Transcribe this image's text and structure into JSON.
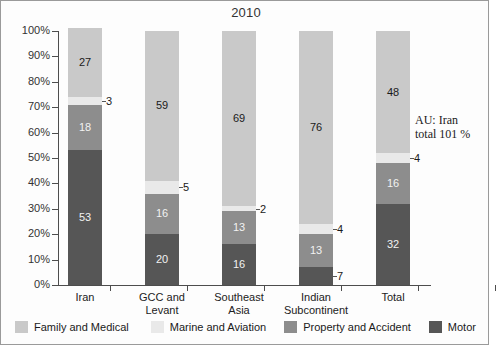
{
  "chart_data": {
    "type": "bar",
    "subtype": "stacked-percentage-column",
    "title": "2010",
    "xlabel": "",
    "ylabel": "",
    "ylim": [
      0,
      100
    ],
    "ytick_labels": [
      "100%",
      "90%",
      "80%",
      "70%",
      "60%",
      "50%",
      "40%",
      "30%",
      "20%",
      "10%",
      "0%"
    ],
    "ytick_values": [
      100,
      90,
      80,
      70,
      60,
      50,
      40,
      30,
      20,
      10,
      0
    ],
    "grid": false,
    "legend_position": "bottom",
    "categories": [
      "Iran",
      "GCC and Levant",
      "Southeast Asia",
      "Indian Subcontinent",
      "Total"
    ],
    "category_lines": [
      [
        "Iran",
        ""
      ],
      [
        "GCC and",
        "Levant"
      ],
      [
        "Southeast",
        "Asia"
      ],
      [
        "Indian",
        "Subcontinent"
      ],
      [
        "Total",
        ""
      ]
    ],
    "series": [
      {
        "name": "Family and Medical",
        "color": "#c9c9c9",
        "values": [
          27,
          59,
          69,
          76,
          48
        ]
      },
      {
        "name": "Marine and Aviation",
        "color": "#e9e9e9",
        "values": [
          3,
          5,
          2,
          4,
          4
        ]
      },
      {
        "name": "Property and Accident",
        "color": "#8d8d8d",
        "values": [
          18,
          16,
          13,
          13,
          16
        ]
      },
      {
        "name": "Motor",
        "color": "#565656",
        "values": [
          53,
          20,
          16,
          7,
          32
        ]
      }
    ],
    "annotations": [
      {
        "id": "au-note",
        "text_lines": [
          "AU: Iran",
          "total 101 %"
        ]
      }
    ]
  },
  "legend": {
    "items": [
      {
        "label": "Family and Medical",
        "color": "#c9c9c9"
      },
      {
        "label": "Marine and Aviation",
        "color": "#e9e9e9"
      },
      {
        "label": "Property and Accident",
        "color": "#8d8d8d"
      },
      {
        "label": "Motor",
        "color": "#565656"
      }
    ]
  },
  "annotation": {
    "line1": "AU: Iran",
    "line2": "total 101 %"
  }
}
